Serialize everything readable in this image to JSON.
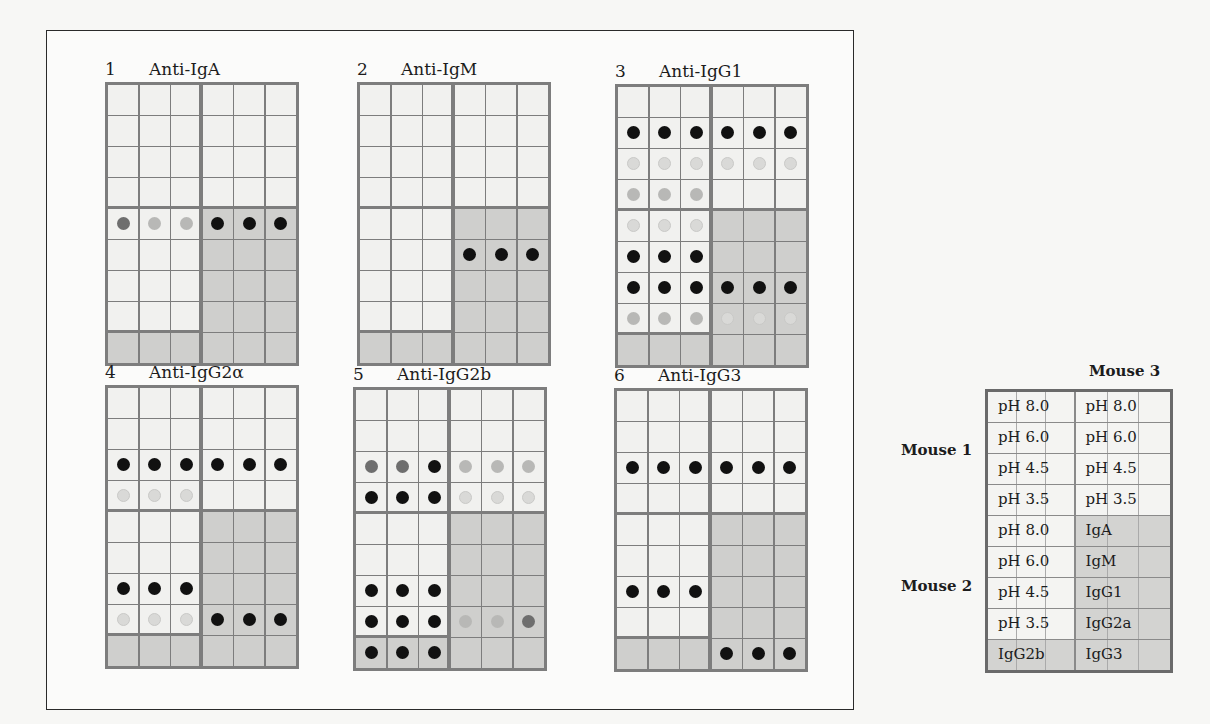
{
  "figure": {
    "panels": [
      {
        "number": "1",
        "title": "Anti-IgA",
        "dots": [
          {
            "row": 4,
            "col": 0,
            "level": "medium"
          },
          {
            "row": 4,
            "col": 1,
            "level": "weak"
          },
          {
            "row": 4,
            "col": 2,
            "level": "weak"
          },
          {
            "row": 4,
            "col": 3,
            "level": "strong"
          },
          {
            "row": 4,
            "col": 4,
            "level": "strong"
          },
          {
            "row": 4,
            "col": 5,
            "level": "strong"
          }
        ]
      },
      {
        "number": "2",
        "title": "Anti-IgM",
        "dots": [
          {
            "row": 5,
            "col": 3,
            "level": "strong"
          },
          {
            "row": 5,
            "col": 4,
            "level": "strong"
          },
          {
            "row": 5,
            "col": 5,
            "level": "strong"
          }
        ]
      },
      {
        "number": "3",
        "title": "Anti-IgG1",
        "dots": [
          {
            "row": 1,
            "col": 0,
            "level": "strong"
          },
          {
            "row": 1,
            "col": 1,
            "level": "strong"
          },
          {
            "row": 1,
            "col": 2,
            "level": "strong"
          },
          {
            "row": 1,
            "col": 3,
            "level": "strong"
          },
          {
            "row": 1,
            "col": 4,
            "level": "strong"
          },
          {
            "row": 1,
            "col": 5,
            "level": "strong"
          },
          {
            "row": 2,
            "col": 0,
            "level": "faint"
          },
          {
            "row": 2,
            "col": 1,
            "level": "faint"
          },
          {
            "row": 2,
            "col": 2,
            "level": "faint"
          },
          {
            "row": 2,
            "col": 3,
            "level": "faint"
          },
          {
            "row": 2,
            "col": 4,
            "level": "faint"
          },
          {
            "row": 2,
            "col": 5,
            "level": "faint"
          },
          {
            "row": 3,
            "col": 0,
            "level": "weak"
          },
          {
            "row": 3,
            "col": 1,
            "level": "weak"
          },
          {
            "row": 3,
            "col": 2,
            "level": "weak"
          },
          {
            "row": 4,
            "col": 0,
            "level": "faint"
          },
          {
            "row": 4,
            "col": 1,
            "level": "faint"
          },
          {
            "row": 4,
            "col": 2,
            "level": "faint"
          },
          {
            "row": 5,
            "col": 0,
            "level": "strong"
          },
          {
            "row": 5,
            "col": 1,
            "level": "strong"
          },
          {
            "row": 5,
            "col": 2,
            "level": "strong"
          },
          {
            "row": 6,
            "col": 0,
            "level": "strong"
          },
          {
            "row": 6,
            "col": 1,
            "level": "strong"
          },
          {
            "row": 6,
            "col": 2,
            "level": "strong"
          },
          {
            "row": 6,
            "col": 3,
            "level": "strong"
          },
          {
            "row": 6,
            "col": 4,
            "level": "strong"
          },
          {
            "row": 6,
            "col": 5,
            "level": "strong"
          },
          {
            "row": 7,
            "col": 0,
            "level": "weak"
          },
          {
            "row": 7,
            "col": 1,
            "level": "weak"
          },
          {
            "row": 7,
            "col": 2,
            "level": "weak"
          },
          {
            "row": 7,
            "col": 3,
            "level": "faint"
          },
          {
            "row": 7,
            "col": 4,
            "level": "faint"
          },
          {
            "row": 7,
            "col": 5,
            "level": "faint"
          }
        ]
      },
      {
        "number": "4",
        "title": "Anti-IgG2α",
        "dots": [
          {
            "row": 2,
            "col": 0,
            "level": "strong"
          },
          {
            "row": 2,
            "col": 1,
            "level": "strong"
          },
          {
            "row": 2,
            "col": 2,
            "level": "strong"
          },
          {
            "row": 2,
            "col": 3,
            "level": "strong"
          },
          {
            "row": 2,
            "col": 4,
            "level": "strong"
          },
          {
            "row": 2,
            "col": 5,
            "level": "strong"
          },
          {
            "row": 3,
            "col": 0,
            "level": "faint"
          },
          {
            "row": 3,
            "col": 1,
            "level": "faint"
          },
          {
            "row": 3,
            "col": 2,
            "level": "faint"
          },
          {
            "row": 6,
            "col": 0,
            "level": "strong"
          },
          {
            "row": 6,
            "col": 1,
            "level": "strong"
          },
          {
            "row": 6,
            "col": 2,
            "level": "strong"
          },
          {
            "row": 7,
            "col": 0,
            "level": "faint"
          },
          {
            "row": 7,
            "col": 1,
            "level": "faint"
          },
          {
            "row": 7,
            "col": 2,
            "level": "faint"
          },
          {
            "row": 7,
            "col": 3,
            "level": "strong"
          },
          {
            "row": 7,
            "col": 4,
            "level": "strong"
          },
          {
            "row": 7,
            "col": 5,
            "level": "strong"
          }
        ]
      },
      {
        "number": "5",
        "title": "Anti-IgG2b",
        "dots": [
          {
            "row": 2,
            "col": 0,
            "level": "medium"
          },
          {
            "row": 2,
            "col": 1,
            "level": "medium"
          },
          {
            "row": 2,
            "col": 2,
            "level": "strong"
          },
          {
            "row": 2,
            "col": 3,
            "level": "weak"
          },
          {
            "row": 2,
            "col": 4,
            "level": "weak"
          },
          {
            "row": 2,
            "col": 5,
            "level": "weak"
          },
          {
            "row": 3,
            "col": 0,
            "level": "strong"
          },
          {
            "row": 3,
            "col": 1,
            "level": "strong"
          },
          {
            "row": 3,
            "col": 2,
            "level": "strong"
          },
          {
            "row": 3,
            "col": 3,
            "level": "faint"
          },
          {
            "row": 3,
            "col": 4,
            "level": "faint"
          },
          {
            "row": 3,
            "col": 5,
            "level": "faint"
          },
          {
            "row": 6,
            "col": 0,
            "level": "strong"
          },
          {
            "row": 6,
            "col": 1,
            "level": "strong"
          },
          {
            "row": 6,
            "col": 2,
            "level": "strong"
          },
          {
            "row": 7,
            "col": 0,
            "level": "strong"
          },
          {
            "row": 7,
            "col": 1,
            "level": "strong"
          },
          {
            "row": 7,
            "col": 2,
            "level": "strong"
          },
          {
            "row": 7,
            "col": 3,
            "level": "weak"
          },
          {
            "row": 7,
            "col": 4,
            "level": "weak"
          },
          {
            "row": 7,
            "col": 5,
            "level": "medium"
          },
          {
            "row": 8,
            "col": 0,
            "level": "strong"
          },
          {
            "row": 8,
            "col": 1,
            "level": "strong"
          },
          {
            "row": 8,
            "col": 2,
            "level": "strong"
          }
        ]
      },
      {
        "number": "6",
        "title": "Anti-IgG3",
        "dots": [
          {
            "row": 2,
            "col": 0,
            "level": "strong"
          },
          {
            "row": 2,
            "col": 1,
            "level": "strong"
          },
          {
            "row": 2,
            "col": 2,
            "level": "strong"
          },
          {
            "row": 2,
            "col": 3,
            "level": "strong"
          },
          {
            "row": 2,
            "col": 4,
            "level": "strong"
          },
          {
            "row": 2,
            "col": 5,
            "level": "strong"
          },
          {
            "row": 6,
            "col": 0,
            "level": "strong"
          },
          {
            "row": 6,
            "col": 1,
            "level": "strong"
          },
          {
            "row": 6,
            "col": 2,
            "level": "strong"
          },
          {
            "row": 8,
            "col": 3,
            "level": "strong"
          },
          {
            "row": 8,
            "col": 4,
            "level": "strong"
          },
          {
            "row": 8,
            "col": 5,
            "level": "strong"
          }
        ]
      }
    ]
  },
  "key": {
    "top_label": "Mouse 3",
    "side_labels": [
      "Mouse 1",
      "Mouse 2"
    ],
    "rows": [
      [
        "pH 8.0",
        "pH 8.0"
      ],
      [
        "pH 6.0",
        "pH 6.0"
      ],
      [
        "pH 4.5",
        "pH 4.5"
      ],
      [
        "pH 3.5",
        "pH 3.5"
      ],
      [
        "pH 8.0",
        "IgA"
      ],
      [
        "pH 6.0",
        "IgM"
      ],
      [
        "pH 4.5",
        "IgG1"
      ],
      [
        "pH 3.5",
        "IgG2a"
      ],
      [
        "IgG2b",
        "IgG3"
      ]
    ]
  }
}
